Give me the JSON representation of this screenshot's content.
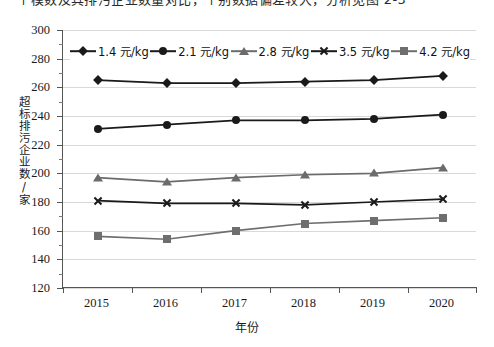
{
  "page": {
    "clipped_top_text": "一个模数及其排污企业数量对比，个别数据偏差较大，分析见图 2-3"
  },
  "chart_data": {
    "type": "line",
    "title": "",
    "xlabel": "年份",
    "ylabel": "超标排污企业数/家",
    "categories": [
      "2015",
      "2016",
      "2017",
      "2018",
      "2019",
      "2020"
    ],
    "ylim": [
      120,
      300
    ],
    "ytick_step": 20,
    "yticks": [
      120,
      140,
      160,
      180,
      200,
      220,
      240,
      260,
      280,
      300
    ],
    "grid": true,
    "legend_position": "top-inside",
    "series": [
      {
        "name": "1.4 元/kg",
        "marker": "diamond",
        "color": "#1a1a1a",
        "values": [
          265,
          263,
          263,
          264,
          265,
          268
        ]
      },
      {
        "name": "2.1 元/kg",
        "marker": "circle",
        "color": "#1a1a1a",
        "values": [
          231,
          234,
          237,
          237,
          238,
          241
        ]
      },
      {
        "name": "2.8 元/kg",
        "marker": "triangle",
        "color": "#6b6b6b",
        "values": [
          197,
          194,
          197,
          199,
          200,
          204
        ]
      },
      {
        "name": "3.5 元/kg",
        "marker": "cross",
        "color": "#1a1a1a",
        "values": [
          181,
          179,
          179,
          178,
          180,
          182
        ]
      },
      {
        "name": "4.2 元/kg",
        "marker": "square",
        "color": "#6e6e6e",
        "values": [
          156,
          154,
          160,
          165,
          167,
          169
        ]
      }
    ]
  }
}
